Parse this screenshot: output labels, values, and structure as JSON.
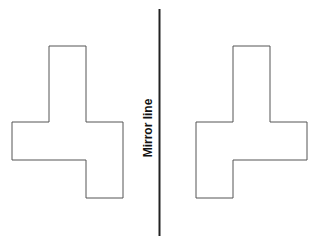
{
  "diagram": {
    "mirror_label": "Mirror line",
    "colors": {
      "shape_stroke": "#555555",
      "mirror_line": "#222222",
      "background": "#ffffff"
    },
    "mirror_line": {
      "x": 159.5,
      "y1": 9,
      "y2": 236
    },
    "left_shape": {
      "points": "49,46 86,46 86,122 123,122 123,198 86,198 86,160 12,160 12,122 49,122"
    },
    "right_shape": {
      "points": "233,46 270,46 270,122 307,122 307,160 233,160 233,198 196,198 196,122 233,122"
    }
  }
}
